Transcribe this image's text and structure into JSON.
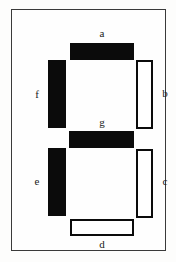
{
  "figure": {
    "kind": "seven-segment-display",
    "background_color": "#fdfdfc",
    "frame_color": "#3a3a3a",
    "segment_on_color": "#0b0b0b",
    "segment_off_color": "#ffffff",
    "label_color": "#1a1a1a"
  },
  "segments": [
    {
      "id": "a",
      "label": "a",
      "orientation": "horizontal",
      "position": "top",
      "state": "on",
      "fill": "solid"
    },
    {
      "id": "b",
      "label": "b",
      "orientation": "vertical",
      "position": "upper-right",
      "state": "off",
      "fill": "outline"
    },
    {
      "id": "c",
      "label": "c",
      "orientation": "vertical",
      "position": "lower-right",
      "state": "off",
      "fill": "outline"
    },
    {
      "id": "d",
      "label": "d",
      "orientation": "horizontal",
      "position": "bottom",
      "state": "off",
      "fill": "outline"
    },
    {
      "id": "e",
      "label": "e",
      "orientation": "vertical",
      "position": "lower-left",
      "state": "on",
      "fill": "solid"
    },
    {
      "id": "f",
      "label": "f",
      "orientation": "vertical",
      "position": "upper-left",
      "state": "on",
      "fill": "solid"
    },
    {
      "id": "g",
      "label": "g",
      "orientation": "horizontal",
      "position": "middle",
      "state": "on",
      "fill": "solid"
    }
  ]
}
